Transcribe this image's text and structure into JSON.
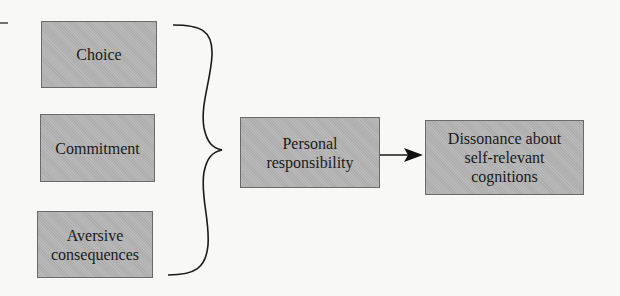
{
  "diagram": {
    "causes": [
      {
        "id": "choice",
        "label": "Choice"
      },
      {
        "id": "commitment",
        "label": "Commitment"
      },
      {
        "id": "aversive-consequences",
        "label": "Aversive\nconsequences"
      }
    ],
    "mediator": {
      "id": "personal-responsibility",
      "label": "Personal\nresponsibility"
    },
    "outcome": {
      "id": "dissonance",
      "label": "Dissonance about\nself-relevant\ncognitions"
    },
    "connectors": {
      "brace": "groups Choice, Commitment, Aversive consequences into Personal responsibility",
      "arrow": "Personal responsibility -> Dissonance about self-relevant cognitions"
    },
    "colors": {
      "box_fill": "#b4b4b4",
      "box_border": "#6a6a6a",
      "line": "#1a1a1a",
      "background": "#f8f8f7"
    }
  }
}
